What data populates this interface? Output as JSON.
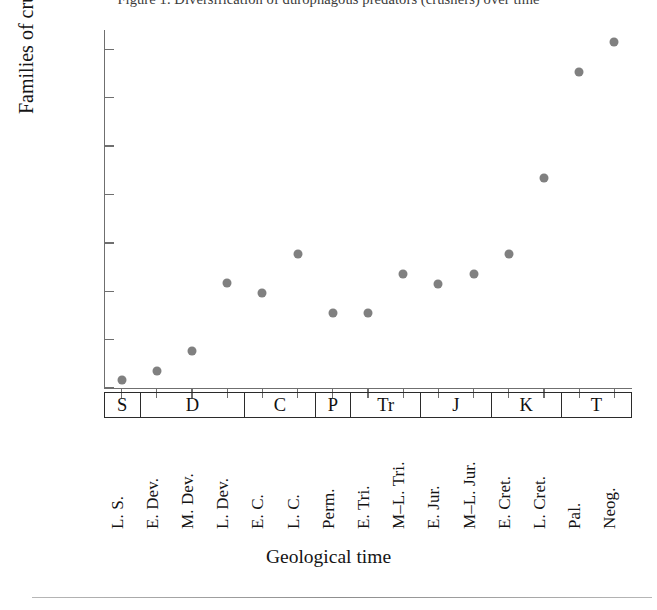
{
  "figure": {
    "top_caption": "Figure 1.  Diversification of durophagous predators (crushers) over time",
    "bottom_rule": true
  },
  "chart_data": {
    "type": "scatter",
    "title": "",
    "xlabel": "Geological time",
    "ylabel": "Families of crushers",
    "ylim": [
      0,
      37
    ],
    "yticks": [
      0,
      5,
      10,
      15,
      20,
      25,
      30,
      35
    ],
    "ytick_labels": [
      "0",
      "5",
      "10",
      "15",
      "20",
      "25",
      "30",
      "35"
    ],
    "grid": false,
    "legend": null,
    "marker": {
      "shape": "circle",
      "color": "#808080",
      "size": 9
    },
    "categories": [
      "L. S.",
      "E. Dev.",
      "M. Dev.",
      "L. Dev.",
      "E. C.",
      "L. C.",
      "Perm.",
      "E. Tri.",
      "M–L. Tri.",
      "E. Jur.",
      "M–L. Jur.",
      "E. Cret.",
      "L. Cret.",
      "Pal.",
      "Neog."
    ],
    "values": [
      0.8,
      1.8,
      3.8,
      10.9,
      9.8,
      13.9,
      7.8,
      7.8,
      11.8,
      10.8,
      11.8,
      13.8,
      21.7,
      32.7,
      35.8
    ],
    "periods": [
      {
        "label": "S",
        "span": 1
      },
      {
        "label": "D",
        "span": 3
      },
      {
        "label": "C",
        "span": 2
      },
      {
        "label": "P",
        "span": 1
      },
      {
        "label": "Tr",
        "span": 2
      },
      {
        "label": "J",
        "span": 2
      },
      {
        "label": "K",
        "span": 2
      },
      {
        "label": "T",
        "span": 2
      }
    ]
  }
}
